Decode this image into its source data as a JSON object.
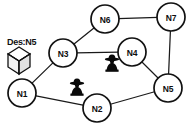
{
  "diagram": {
    "type": "network-graph",
    "width": 194,
    "height": 127,
    "background_color": "#ffffff",
    "node_stroke_color": "#111111",
    "edge_stroke_color": "#1a1a1a",
    "attacker_color": "#0a0a0a"
  },
  "nodes": [
    {
      "id": "N1",
      "label": "N1",
      "cx": 22,
      "cy": 93,
      "r": 14
    },
    {
      "id": "N2",
      "label": "N2",
      "cx": 97,
      "cy": 108,
      "r": 14
    },
    {
      "id": "N3",
      "label": "N3",
      "cx": 63,
      "cy": 53,
      "r": 14
    },
    {
      "id": "N4",
      "label": "N4",
      "cx": 132,
      "cy": 52,
      "r": 14
    },
    {
      "id": "N5",
      "label": "N5",
      "cx": 168,
      "cy": 88,
      "r": 14
    },
    {
      "id": "N6",
      "label": "N6",
      "cx": 105,
      "cy": 19,
      "r": 14
    },
    {
      "id": "N7",
      "label": "N7",
      "cx": 171,
      "cy": 17,
      "r": 14
    }
  ],
  "edges": [
    {
      "from": "N1",
      "to": "N3"
    },
    {
      "from": "N1",
      "to": "N2"
    },
    {
      "from": "N2",
      "to": "N5"
    },
    {
      "from": "N3",
      "to": "N6"
    },
    {
      "from": "N3",
      "to": "N4"
    },
    {
      "from": "N4",
      "to": "N5"
    },
    {
      "from": "N6",
      "to": "N7"
    },
    {
      "from": "N7",
      "to": "N5"
    }
  ],
  "annotations": {
    "destination": {
      "text": "Des:N5",
      "text_x": 7,
      "text_y": 45,
      "icon_name": "package-box-icon",
      "icon_x": 8,
      "icon_y": 47,
      "attached_to": "N1"
    },
    "attackers": [
      {
        "icon_name": "attacker-figure-icon",
        "x": 104,
        "y": 54,
        "near": "N4"
      },
      {
        "icon_name": "attacker-figure-icon",
        "x": 69,
        "y": 78,
        "near": "N2"
      }
    ]
  }
}
